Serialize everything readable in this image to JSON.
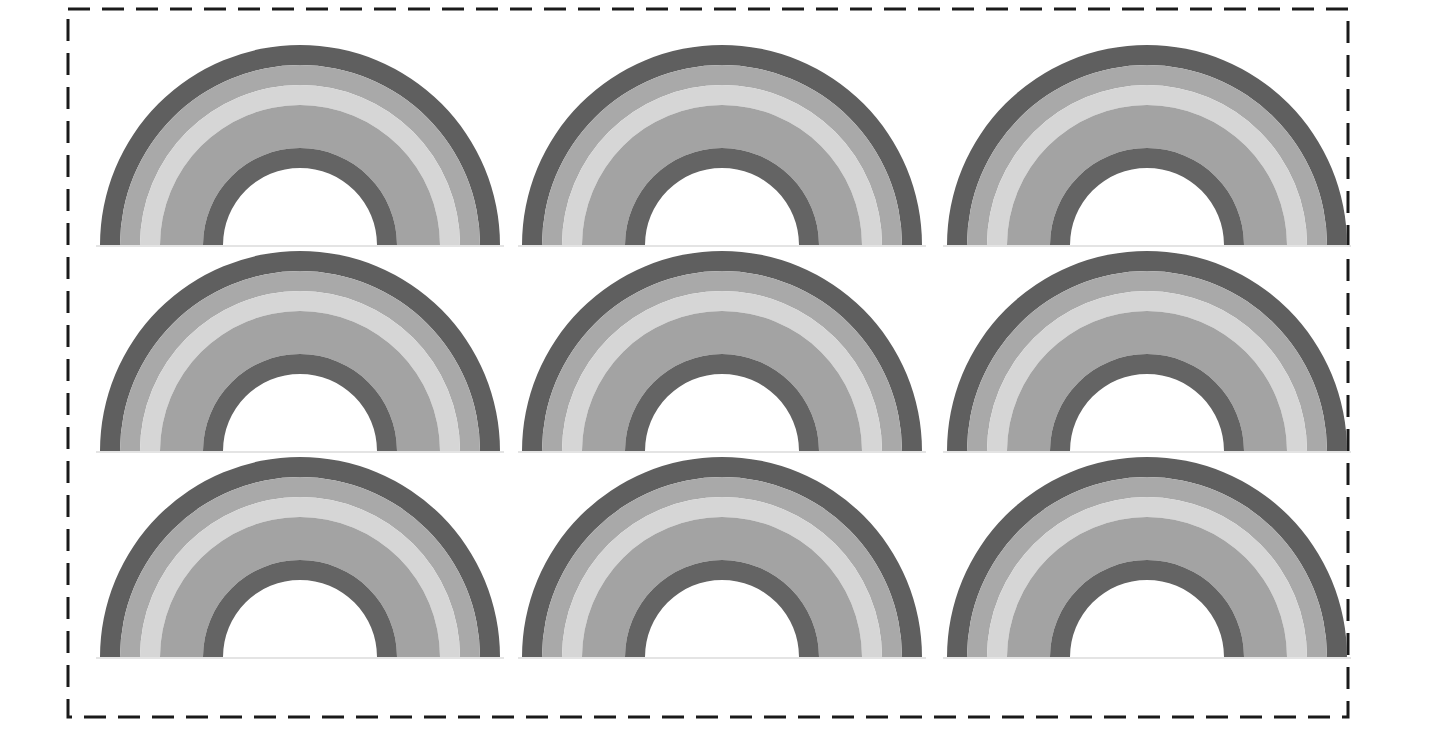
{
  "page": {
    "background": "#ffffff",
    "border": {
      "style": "dashed",
      "color": "#1a1a1a",
      "x1": 68,
      "y1": 9,
      "x2": 1348,
      "y2": 717,
      "stroke_width": 3,
      "dash": [
        22,
        12
      ]
    }
  },
  "rainbow": {
    "outer_radius": 200,
    "bands": [
      {
        "name": "outer-dark",
        "outer": 200,
        "inner": 180,
        "color": "#5f5f5f"
      },
      {
        "name": "medium",
        "outer": 180,
        "inner": 160,
        "color": "#a9a9a9"
      },
      {
        "name": "light",
        "outer": 160,
        "inner": 140,
        "color": "#d6d6d6"
      },
      {
        "name": "medium-wide",
        "outer": 140,
        "inner": 97,
        "color": "#a3a3a3"
      },
      {
        "name": "inner-dark",
        "outer": 97,
        "inner": 77,
        "color": "#646464"
      }
    ],
    "ground_color": "#e4e4e4"
  },
  "grid": {
    "columns": [
      300,
      722,
      1147
    ],
    "rows": [
      245,
      451,
      657
    ]
  }
}
